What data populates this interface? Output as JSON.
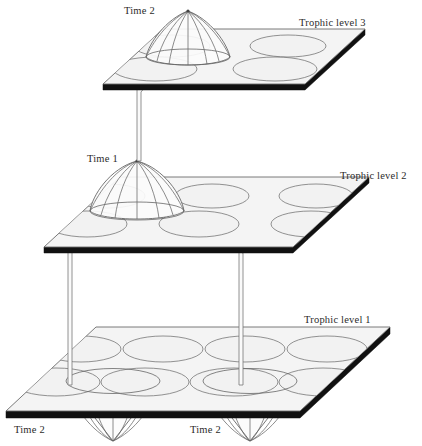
{
  "figure": {
    "type": "scientific-diagram",
    "background_color": "#ffffff",
    "plane_fill_color": "#f4f4f4",
    "plane_edge_color": "#111111",
    "patch_stroke_color": "#777777",
    "line_color": "#666666"
  },
  "levels": [
    {
      "id": "trophic-level-3",
      "label": "Trophic level 3",
      "patch_grid": {
        "columns": 2,
        "rows": 2,
        "count": 4
      },
      "structures": [
        {
          "kind": "cone-up",
          "label": "Time 2",
          "position": "upper-left-patch"
        }
      ]
    },
    {
      "id": "trophic-level-2",
      "label": "Trophic level 2",
      "patch_grid": {
        "columns": 3,
        "rows": 2,
        "count": 6
      },
      "structures": [
        {
          "kind": "cone-up",
          "label": "Time 1",
          "position": "upper-left-patch"
        }
      ]
    },
    {
      "id": "trophic-level-1",
      "label": "Trophic level 1",
      "patch_grid": {
        "columns": 4,
        "rows": 2,
        "count": 8
      },
      "structures": [
        {
          "kind": "funnel-down",
          "label": "Time 2",
          "position": "lower-row-column-1"
        },
        {
          "kind": "funnel-down",
          "label": "Time 2",
          "position": "lower-row-column-3"
        }
      ]
    }
  ],
  "labels": {
    "trophic_level_3": "Trophic level 3",
    "trophic_level_2": "Trophic level 2",
    "trophic_level_1": "Trophic level 1",
    "time_2_top": "Time 2",
    "time_1_middle": "Time 1",
    "time_2_bottom_left": "Time 2",
    "time_2_bottom_right": "Time 2"
  },
  "connectors": [
    {
      "id": "rod-mid-to-top",
      "from": "trophic-level-2 cone apex",
      "to": "trophic-level-3 plane",
      "shape": "vertical"
    },
    {
      "id": "rod-mid-to-bottom-left",
      "from": "trophic-level-2 cone base",
      "to": "trophic-level-1 funnel left",
      "shape": "bent"
    },
    {
      "id": "rod-mid-to-bottom-right",
      "from": "trophic-level-2 cone base",
      "to": "trophic-level-1 funnel right",
      "shape": "bent"
    }
  ]
}
